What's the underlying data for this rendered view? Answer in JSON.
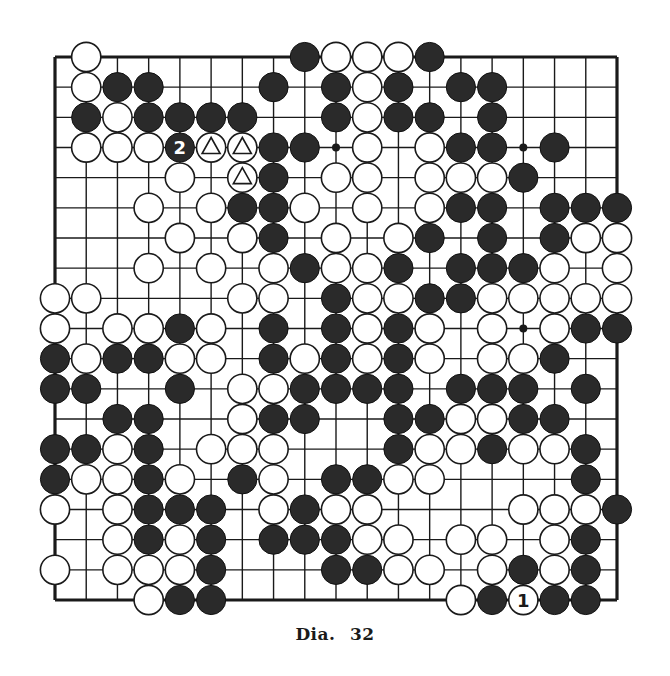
{
  "diagram": {
    "caption_label": "Dia.",
    "caption_number": "32",
    "board_size": 19,
    "colors": {
      "black_stone": "#2a2a2a",
      "white_stone": "#ffffff",
      "line": "#1a1a1a",
      "paper": "#ffffff"
    },
    "hoshi": [
      [
        3,
        3
      ],
      [
        3,
        9
      ],
      [
        3,
        15
      ],
      [
        9,
        3
      ],
      [
        9,
        9
      ],
      [
        9,
        15
      ],
      [
        15,
        3
      ],
      [
        15,
        9
      ],
      [
        15,
        15
      ]
    ],
    "visible_hoshi": [
      [
        3,
        9
      ],
      [
        3,
        15
      ],
      [
        9,
        15
      ]
    ],
    "rows": [
      ".W......BWWWB......",
      ".WBB...B.BWB.BB....",
      ".BWBBBB..BWBB.B....",
      ".WWWbtt BB.W.WBB.B..",
      "....W.tB.WW.WWWB...",
      "...W.WBBW.W.WBB.BBB",
      "....W.WB.W.WB.B.BWW",
      "...W.W.WBWWB.BBBW.W",
      "WW....WW.BWWBBWWWWW",
      "W.WWBW.B.BWBW.W.WBB",
      "BWBBWW.BWBWBW.WWB..",
      "BB..B.WWBBBB.BBB.B.",
      "..BB..WBB..BBWWBB..",
      "BBWB.WWW...BWWBWWB.",
      "BWWBW.BW.BBWW....B.",
      "W.WBBB.WBWW....WWWB",
      "..WBWB.BBBWW.WW.WB.",
      "W.WWWB...BBWW.WBWB.",
      "...WBB.......WBwBB."
    ],
    "stones": [
      {
        "r": 0,
        "c": 1,
        "color": "W"
      },
      {
        "r": 0,
        "c": 8,
        "color": "B"
      },
      {
        "r": 0,
        "c": 9,
        "color": "W"
      },
      {
        "r": 0,
        "c": 10,
        "color": "W"
      },
      {
        "r": 0,
        "c": 11,
        "color": "W"
      },
      {
        "r": 0,
        "c": 12,
        "color": "B"
      },
      {
        "r": 1,
        "c": 1,
        "color": "W"
      },
      {
        "r": 1,
        "c": 2,
        "color": "B"
      },
      {
        "r": 1,
        "c": 3,
        "color": "B"
      },
      {
        "r": 1,
        "c": 7,
        "color": "B"
      },
      {
        "r": 1,
        "c": 9,
        "color": "B"
      },
      {
        "r": 1,
        "c": 10,
        "color": "W"
      },
      {
        "r": 1,
        "c": 11,
        "color": "B"
      },
      {
        "r": 1,
        "c": 13,
        "color": "B"
      },
      {
        "r": 1,
        "c": 14,
        "color": "B"
      },
      {
        "r": 2,
        "c": 1,
        "color": "B"
      },
      {
        "r": 2,
        "c": 2,
        "color": "W"
      },
      {
        "r": 2,
        "c": 3,
        "color": "B"
      },
      {
        "r": 2,
        "c": 4,
        "color": "B"
      },
      {
        "r": 2,
        "c": 5,
        "color": "B"
      },
      {
        "r": 2,
        "c": 6,
        "color": "B"
      },
      {
        "r": 2,
        "c": 9,
        "color": "B"
      },
      {
        "r": 2,
        "c": 10,
        "color": "W"
      },
      {
        "r": 2,
        "c": 11,
        "color": "B"
      },
      {
        "r": 2,
        "c": 12,
        "color": "B"
      },
      {
        "r": 2,
        "c": 14,
        "color": "B"
      },
      {
        "r": 3,
        "c": 1,
        "color": "W"
      },
      {
        "r": 3,
        "c": 2,
        "color": "W"
      },
      {
        "r": 3,
        "c": 3,
        "color": "W"
      },
      {
        "r": 3,
        "c": 4,
        "color": "B",
        "label": "2"
      },
      {
        "r": 3,
        "c": 5,
        "color": "W",
        "mark": "triangle"
      },
      {
        "r": 3,
        "c": 6,
        "color": "W",
        "mark": "triangle"
      },
      {
        "r": 3,
        "c": 7,
        "color": "B"
      },
      {
        "r": 3,
        "c": 8,
        "color": "B"
      },
      {
        "r": 3,
        "c": 10,
        "color": "W"
      },
      {
        "r": 3,
        "c": 12,
        "color": "W"
      },
      {
        "r": 3,
        "c": 13,
        "color": "B"
      },
      {
        "r": 3,
        "c": 14,
        "color": "B"
      },
      {
        "r": 3,
        "c": 16,
        "color": "B"
      },
      {
        "r": 4,
        "c": 4,
        "color": "W"
      },
      {
        "r": 4,
        "c": 6,
        "color": "W",
        "mark": "triangle"
      },
      {
        "r": 4,
        "c": 7,
        "color": "B"
      },
      {
        "r": 4,
        "c": 9,
        "color": "W"
      },
      {
        "r": 4,
        "c": 10,
        "color": "W"
      },
      {
        "r": 4,
        "c": 12,
        "color": "W"
      },
      {
        "r": 4,
        "c": 13,
        "color": "W"
      },
      {
        "r": 4,
        "c": 14,
        "color": "W"
      },
      {
        "r": 4,
        "c": 15,
        "color": "B"
      },
      {
        "r": 5,
        "c": 3,
        "color": "W"
      },
      {
        "r": 5,
        "c": 5,
        "color": "W"
      },
      {
        "r": 5,
        "c": 6,
        "color": "B"
      },
      {
        "r": 5,
        "c": 7,
        "color": "B"
      },
      {
        "r": 5,
        "c": 8,
        "color": "W"
      },
      {
        "r": 5,
        "c": 10,
        "color": "W"
      },
      {
        "r": 5,
        "c": 12,
        "color": "W"
      },
      {
        "r": 5,
        "c": 13,
        "color": "B"
      },
      {
        "r": 5,
        "c": 14,
        "color": "B"
      },
      {
        "r": 5,
        "c": 16,
        "color": "B"
      },
      {
        "r": 5,
        "c": 17,
        "color": "B"
      },
      {
        "r": 5,
        "c": 18,
        "color": "B"
      },
      {
        "r": 6,
        "c": 4,
        "color": "W"
      },
      {
        "r": 6,
        "c": 6,
        "color": "W"
      },
      {
        "r": 6,
        "c": 7,
        "color": "B"
      },
      {
        "r": 6,
        "c": 9,
        "color": "W"
      },
      {
        "r": 6,
        "c": 11,
        "color": "W"
      },
      {
        "r": 6,
        "c": 12,
        "color": "B"
      },
      {
        "r": 6,
        "c": 14,
        "color": "B"
      },
      {
        "r": 6,
        "c": 16,
        "color": "B"
      },
      {
        "r": 6,
        "c": 17,
        "color": "W"
      },
      {
        "r": 6,
        "c": 18,
        "color": "W"
      },
      {
        "r": 7,
        "c": 3,
        "color": "W"
      },
      {
        "r": 7,
        "c": 5,
        "color": "W"
      },
      {
        "r": 7,
        "c": 7,
        "color": "W"
      },
      {
        "r": 7,
        "c": 8,
        "color": "B"
      },
      {
        "r": 7,
        "c": 9,
        "color": "W"
      },
      {
        "r": 7,
        "c": 10,
        "color": "W"
      },
      {
        "r": 7,
        "c": 11,
        "color": "B"
      },
      {
        "r": 7,
        "c": 13,
        "color": "B"
      },
      {
        "r": 7,
        "c": 14,
        "color": "B"
      },
      {
        "r": 7,
        "c": 15,
        "color": "B"
      },
      {
        "r": 7,
        "c": 16,
        "color": "W"
      },
      {
        "r": 7,
        "c": 18,
        "color": "W"
      },
      {
        "r": 8,
        "c": 0,
        "color": "W"
      },
      {
        "r": 8,
        "c": 1,
        "color": "W"
      },
      {
        "r": 8,
        "c": 6,
        "color": "W"
      },
      {
        "r": 8,
        "c": 7,
        "color": "W"
      },
      {
        "r": 8,
        "c": 9,
        "color": "B"
      },
      {
        "r": 8,
        "c": 10,
        "color": "W"
      },
      {
        "r": 8,
        "c": 11,
        "color": "W"
      },
      {
        "r": 8,
        "c": 12,
        "color": "B"
      },
      {
        "r": 8,
        "c": 13,
        "color": "B"
      },
      {
        "r": 8,
        "c": 14,
        "color": "W"
      },
      {
        "r": 8,
        "c": 15,
        "color": "W"
      },
      {
        "r": 8,
        "c": 16,
        "color": "W"
      },
      {
        "r": 8,
        "c": 17,
        "color": "W"
      },
      {
        "r": 8,
        "c": 18,
        "color": "W"
      },
      {
        "r": 9,
        "c": 0,
        "color": "W"
      },
      {
        "r": 9,
        "c": 2,
        "color": "W"
      },
      {
        "r": 9,
        "c": 3,
        "color": "W"
      },
      {
        "r": 9,
        "c": 4,
        "color": "B"
      },
      {
        "r": 9,
        "c": 5,
        "color": "W"
      },
      {
        "r": 9,
        "c": 7,
        "color": "B"
      },
      {
        "r": 9,
        "c": 9,
        "color": "B"
      },
      {
        "r": 9,
        "c": 10,
        "color": "W"
      },
      {
        "r": 9,
        "c": 11,
        "color": "B"
      },
      {
        "r": 9,
        "c": 12,
        "color": "W"
      },
      {
        "r": 9,
        "c": 14,
        "color": "W"
      },
      {
        "r": 9,
        "c": 16,
        "color": "W"
      },
      {
        "r": 9,
        "c": 17,
        "color": "B"
      },
      {
        "r": 9,
        "c": 18,
        "color": "B"
      },
      {
        "r": 10,
        "c": 0,
        "color": "B"
      },
      {
        "r": 10,
        "c": 1,
        "color": "W"
      },
      {
        "r": 10,
        "c": 2,
        "color": "B"
      },
      {
        "r": 10,
        "c": 3,
        "color": "B"
      },
      {
        "r": 10,
        "c": 4,
        "color": "W"
      },
      {
        "r": 10,
        "c": 5,
        "color": "W"
      },
      {
        "r": 10,
        "c": 7,
        "color": "B"
      },
      {
        "r": 10,
        "c": 8,
        "color": "W"
      },
      {
        "r": 10,
        "c": 9,
        "color": "B"
      },
      {
        "r": 10,
        "c": 10,
        "color": "W"
      },
      {
        "r": 10,
        "c": 11,
        "color": "B"
      },
      {
        "r": 10,
        "c": 12,
        "color": "W"
      },
      {
        "r": 10,
        "c": 14,
        "color": "W"
      },
      {
        "r": 10,
        "c": 15,
        "color": "W"
      },
      {
        "r": 10,
        "c": 16,
        "color": "B"
      },
      {
        "r": 11,
        "c": 0,
        "color": "B"
      },
      {
        "r": 11,
        "c": 1,
        "color": "B"
      },
      {
        "r": 11,
        "c": 4,
        "color": "B"
      },
      {
        "r": 11,
        "c": 6,
        "color": "W"
      },
      {
        "r": 11,
        "c": 7,
        "color": "W"
      },
      {
        "r": 11,
        "c": 8,
        "color": "B"
      },
      {
        "r": 11,
        "c": 9,
        "color": "B"
      },
      {
        "r": 11,
        "c": 10,
        "color": "B"
      },
      {
        "r": 11,
        "c": 11,
        "color": "B"
      },
      {
        "r": 11,
        "c": 13,
        "color": "B"
      },
      {
        "r": 11,
        "c": 14,
        "color": "B"
      },
      {
        "r": 11,
        "c": 15,
        "color": "B"
      },
      {
        "r": 11,
        "c": 17,
        "color": "B"
      },
      {
        "r": 12,
        "c": 2,
        "color": "B"
      },
      {
        "r": 12,
        "c": 3,
        "color": "B"
      },
      {
        "r": 12,
        "c": 6,
        "color": "W"
      },
      {
        "r": 12,
        "c": 7,
        "color": "B"
      },
      {
        "r": 12,
        "c": 8,
        "color": "B"
      },
      {
        "r": 12,
        "c": 11,
        "color": "B"
      },
      {
        "r": 12,
        "c": 12,
        "color": "B"
      },
      {
        "r": 12,
        "c": 13,
        "color": "W"
      },
      {
        "r": 12,
        "c": 14,
        "color": "W"
      },
      {
        "r": 12,
        "c": 15,
        "color": "B"
      },
      {
        "r": 12,
        "c": 16,
        "color": "B"
      },
      {
        "r": 13,
        "c": 0,
        "color": "B"
      },
      {
        "r": 13,
        "c": 1,
        "color": "B"
      },
      {
        "r": 13,
        "c": 2,
        "color": "W"
      },
      {
        "r": 13,
        "c": 3,
        "color": "B"
      },
      {
        "r": 13,
        "c": 5,
        "color": "W"
      },
      {
        "r": 13,
        "c": 6,
        "color": "W"
      },
      {
        "r": 13,
        "c": 7,
        "color": "W"
      },
      {
        "r": 13,
        "c": 11,
        "color": "B"
      },
      {
        "r": 13,
        "c": 12,
        "color": "W"
      },
      {
        "r": 13,
        "c": 13,
        "color": "W"
      },
      {
        "r": 13,
        "c": 14,
        "color": "B"
      },
      {
        "r": 13,
        "c": 15,
        "color": "W"
      },
      {
        "r": 13,
        "c": 16,
        "color": "W"
      },
      {
        "r": 13,
        "c": 17,
        "color": "B"
      },
      {
        "r": 14,
        "c": 0,
        "color": "B"
      },
      {
        "r": 14,
        "c": 1,
        "color": "W"
      },
      {
        "r": 14,
        "c": 2,
        "color": "W"
      },
      {
        "r": 14,
        "c": 3,
        "color": "B"
      },
      {
        "r": 14,
        "c": 4,
        "color": "W"
      },
      {
        "r": 14,
        "c": 6,
        "color": "B"
      },
      {
        "r": 14,
        "c": 7,
        "color": "W"
      },
      {
        "r": 14,
        "c": 9,
        "color": "B"
      },
      {
        "r": 14,
        "c": 10,
        "color": "B"
      },
      {
        "r": 14,
        "c": 11,
        "color": "W"
      },
      {
        "r": 14,
        "c": 12,
        "color": "W"
      },
      {
        "r": 14,
        "c": 17,
        "color": "B"
      },
      {
        "r": 15,
        "c": 0,
        "color": "W"
      },
      {
        "r": 15,
        "c": 2,
        "color": "W"
      },
      {
        "r": 15,
        "c": 3,
        "color": "B"
      },
      {
        "r": 15,
        "c": 4,
        "color": "B"
      },
      {
        "r": 15,
        "c": 5,
        "color": "B"
      },
      {
        "r": 15,
        "c": 7,
        "color": "W"
      },
      {
        "r": 15,
        "c": 8,
        "color": "B"
      },
      {
        "r": 15,
        "c": 9,
        "color": "W"
      },
      {
        "r": 15,
        "c": 10,
        "color": "W"
      },
      {
        "r": 15,
        "c": 15,
        "color": "W"
      },
      {
        "r": 15,
        "c": 16,
        "color": "W"
      },
      {
        "r": 15,
        "c": 17,
        "color": "W"
      },
      {
        "r": 15,
        "c": 18,
        "color": "B"
      },
      {
        "r": 16,
        "c": 2,
        "color": "W"
      },
      {
        "r": 16,
        "c": 3,
        "color": "B"
      },
      {
        "r": 16,
        "c": 4,
        "color": "W"
      },
      {
        "r": 16,
        "c": 5,
        "color": "B"
      },
      {
        "r": 16,
        "c": 7,
        "color": "B"
      },
      {
        "r": 16,
        "c": 8,
        "color": "B"
      },
      {
        "r": 16,
        "c": 9,
        "color": "B"
      },
      {
        "r": 16,
        "c": 10,
        "color": "W"
      },
      {
        "r": 16,
        "c": 11,
        "color": "W"
      },
      {
        "r": 16,
        "c": 13,
        "color": "W"
      },
      {
        "r": 16,
        "c": 14,
        "color": "W"
      },
      {
        "r": 16,
        "c": 16,
        "color": "W"
      },
      {
        "r": 16,
        "c": 17,
        "color": "B"
      },
      {
        "r": 17,
        "c": 0,
        "color": "W"
      },
      {
        "r": 17,
        "c": 2,
        "color": "W"
      },
      {
        "r": 17,
        "c": 3,
        "color": "W"
      },
      {
        "r": 17,
        "c": 4,
        "color": "W"
      },
      {
        "r": 17,
        "c": 5,
        "color": "B"
      },
      {
        "r": 17,
        "c": 9,
        "color": "B"
      },
      {
        "r": 17,
        "c": 10,
        "color": "B"
      },
      {
        "r": 17,
        "c": 11,
        "color": "W"
      },
      {
        "r": 17,
        "c": 12,
        "color": "W"
      },
      {
        "r": 17,
        "c": 14,
        "color": "W"
      },
      {
        "r": 17,
        "c": 15,
        "color": "B"
      },
      {
        "r": 17,
        "c": 16,
        "color": "W"
      },
      {
        "r": 17,
        "c": 17,
        "color": "B"
      },
      {
        "r": 18,
        "c": 3,
        "color": "W"
      },
      {
        "r": 18,
        "c": 4,
        "color": "B"
      },
      {
        "r": 18,
        "c": 5,
        "color": "B"
      },
      {
        "r": 18,
        "c": 13,
        "color": "W"
      },
      {
        "r": 18,
        "c": 14,
        "color": "B"
      },
      {
        "r": 18,
        "c": 15,
        "color": "W",
        "label": "1"
      },
      {
        "r": 18,
        "c": 16,
        "color": "B"
      },
      {
        "r": 18,
        "c": 17,
        "color": "B"
      }
    ]
  }
}
